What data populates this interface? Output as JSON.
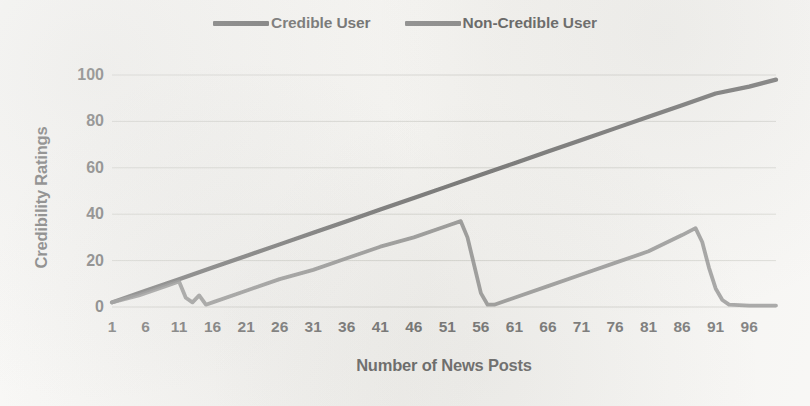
{
  "chart_data": {
    "type": "line",
    "title": "",
    "xlabel": "Number of News Posts",
    "ylabel": "Credibility Ratings",
    "xlim": [
      1,
      100
    ],
    "ylim": [
      0,
      100
    ],
    "grid": true,
    "legend_position": "top-center",
    "xticks": [
      1,
      6,
      11,
      16,
      21,
      26,
      31,
      36,
      41,
      46,
      51,
      56,
      61,
      66,
      71,
      76,
      81,
      86,
      91,
      96
    ],
    "yticks": [
      0,
      20,
      40,
      60,
      80,
      100
    ],
    "series": [
      {
        "name": "Credible User",
        "color": "#4a4a4a",
        "points": [
          [
            1,
            2
          ],
          [
            6,
            7
          ],
          [
            11,
            12
          ],
          [
            16,
            17
          ],
          [
            21,
            22
          ],
          [
            26,
            27
          ],
          [
            31,
            32
          ],
          [
            36,
            37
          ],
          [
            41,
            42
          ],
          [
            46,
            47
          ],
          [
            51,
            52
          ],
          [
            56,
            57
          ],
          [
            61,
            62
          ],
          [
            66,
            67
          ],
          [
            71,
            72
          ],
          [
            76,
            77
          ],
          [
            81,
            82
          ],
          [
            86,
            87
          ],
          [
            91,
            92
          ],
          [
            96,
            95
          ],
          [
            100,
            98
          ]
        ]
      },
      {
        "name": "Non-Credible User",
        "color": "#6f6f6f",
        "points": [
          [
            1,
            2
          ],
          [
            5,
            5
          ],
          [
            9,
            9
          ],
          [
            11,
            11
          ],
          [
            12,
            4
          ],
          [
            13,
            2
          ],
          [
            14,
            5
          ],
          [
            15,
            1
          ],
          [
            16,
            2
          ],
          [
            21,
            7
          ],
          [
            26,
            12
          ],
          [
            31,
            16
          ],
          [
            36,
            21
          ],
          [
            41,
            26
          ],
          [
            46,
            30
          ],
          [
            51,
            35
          ],
          [
            53,
            37
          ],
          [
            54,
            30
          ],
          [
            55,
            18
          ],
          [
            56,
            6
          ],
          [
            57,
            1
          ],
          [
            58,
            1
          ],
          [
            61,
            4
          ],
          [
            66,
            9
          ],
          [
            71,
            14
          ],
          [
            76,
            19
          ],
          [
            81,
            24
          ],
          [
            86,
            31
          ],
          [
            88,
            34
          ],
          [
            89,
            28
          ],
          [
            90,
            17
          ],
          [
            91,
            8
          ],
          [
            92,
            3
          ],
          [
            93,
            1
          ],
          [
            96,
            0.6
          ],
          [
            100,
            0.6
          ]
        ]
      }
    ]
  },
  "legend": {
    "entries": [
      {
        "label": "Credible User",
        "color": "#4a4a4a"
      },
      {
        "label": "Non-Credible User",
        "color": "#6b6b6b"
      }
    ]
  },
  "axes": {
    "y_title": "Credibility Ratings",
    "x_title": "Number of News Posts"
  },
  "colors": {
    "background": "#f4f3f0",
    "gridline": "#c9c9c4",
    "text": "#3f3f3f",
    "credible_line": "#4a4a4a",
    "non_credible_line": "#6f6f6f"
  }
}
